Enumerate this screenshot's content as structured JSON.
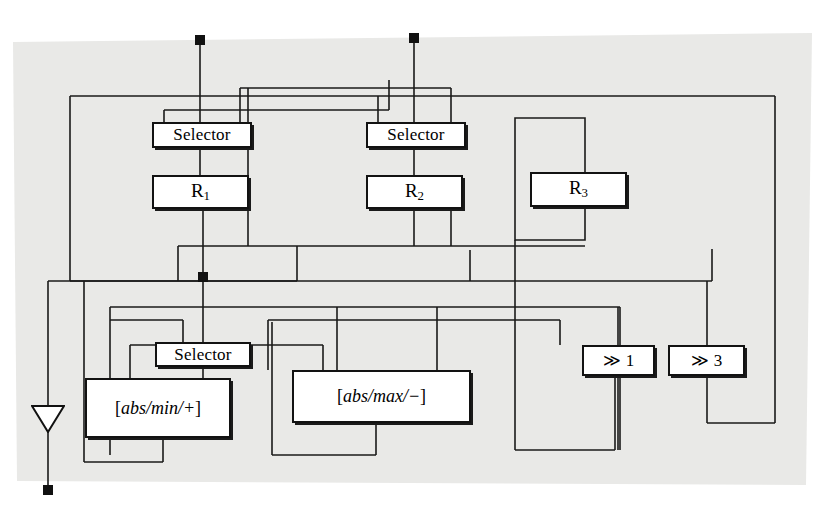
{
  "figure": {
    "type": "block-diagram",
    "title": "",
    "background_color": "#e9e9e7",
    "wire_color": "#1a1a1a",
    "node_fill": "#ffffff",
    "node_border": "#121212"
  },
  "nodes": {
    "selector_1": {
      "label": "Selector",
      "x": 152,
      "y": 122,
      "w": 100,
      "h": 26
    },
    "selector_2": {
      "label": "Selector",
      "x": 366,
      "y": 122,
      "w": 100,
      "h": 26
    },
    "selector_3": {
      "label": "Selector",
      "x": 155,
      "y": 342,
      "w": 96,
      "h": 25
    },
    "register_1": {
      "label": "R",
      "sub": "1",
      "x": 152,
      "y": 175,
      "w": 97,
      "h": 34
    },
    "register_2": {
      "label": "R",
      "sub": "2",
      "x": 366,
      "y": 175,
      "w": 97,
      "h": 34
    },
    "register_3": {
      "label": "R",
      "sub": "3",
      "x": 530,
      "y": 172,
      "w": 97,
      "h": 35
    },
    "alu_min": {
      "label": "[abs/min/+]",
      "open": "[",
      "body": "abs/min/+",
      "close": "]",
      "x": 85,
      "y": 378,
      "w": 146,
      "h": 60
    },
    "alu_max": {
      "label": "[abs/max/−]",
      "open": "[",
      "body": "abs/max/−",
      "close": "]",
      "x": 292,
      "y": 370,
      "w": 179,
      "h": 53
    },
    "shift_1": {
      "label": "≫ 1",
      "glyph": "≫",
      "amount": "1",
      "x": 582,
      "y": 345,
      "w": 73,
      "h": 31
    },
    "shift_3": {
      "label": "≫ 3",
      "glyph": "≫",
      "amount": "3",
      "x": 668,
      "y": 345,
      "w": 77,
      "h": 31
    }
  },
  "terminals": {
    "input_1": {
      "name": "input-terminal-left",
      "x": 200,
      "y": 40
    },
    "input_2": {
      "name": "input-terminal-right",
      "x": 414,
      "y": 38
    },
    "output": {
      "name": "output-terminal",
      "x": 48,
      "y": 490
    },
    "junction": {
      "name": "wire-junction",
      "x": 203,
      "y": 277
    }
  },
  "output_marker": {
    "name": "output-triangle",
    "x": 48,
    "y": 406,
    "w": 34,
    "h": 26
  }
}
